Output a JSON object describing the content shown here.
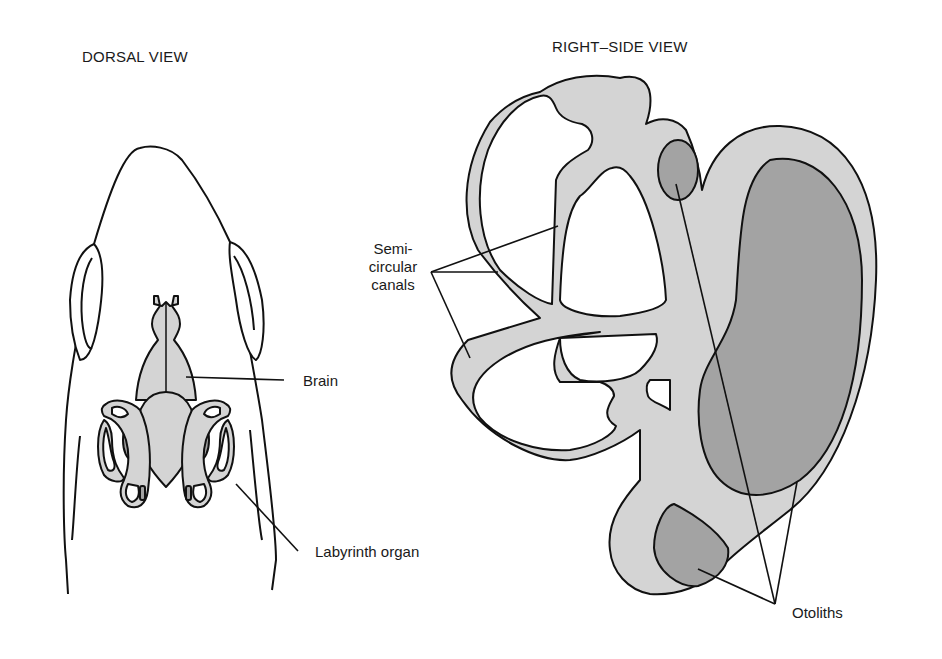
{
  "diagram": {
    "colors": {
      "outline": "#111111",
      "light_fill": "#d4d4d4",
      "dark_fill": "#a3a3a3",
      "background": "#ffffff"
    },
    "left_panel": {
      "title": "DORSAL VIEW",
      "labels": {
        "brain": "Brain",
        "labyrinth": "Labyrinth organ"
      }
    },
    "right_panel": {
      "title": "RIGHT–SIDE VIEW",
      "labels": {
        "canals_line1": "Semi-",
        "canals_line2": "circular",
        "canals_line3": "canals",
        "otoliths": "Otoliths"
      }
    }
  }
}
